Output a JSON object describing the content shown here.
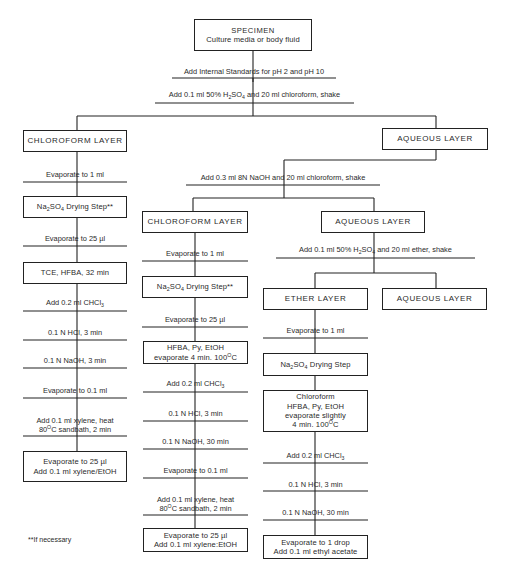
{
  "flowchart": {
    "specimen": {
      "title": "SPECIMEN",
      "subtitle": "Culture media or body fluid"
    },
    "step_internal_standards": "Add Internal Standards for pH 2 and pH 10",
    "step_acid_chloroform": {
      "pre": "Add 0.1 ml 50% H",
      "sub1": "2",
      "mid": "SO",
      "sub2": "4",
      "post": " and 20 ml chloroform, shake"
    },
    "left_branch": {
      "layer": "CHLOROFORM LAYER",
      "steps": {
        "evap_1ml": "Evaporate to 1 ml",
        "drying": {
          "pre": "Na",
          "sub1": "2",
          "mid": "SO",
          "sub2": "4",
          "post": " Drying Step**"
        },
        "evap_25ul": "Evaporate to 25 µl",
        "derivatize": "TCE, HFBA, 32 min",
        "add_chcl3": {
          "pre": "Add 0.2 ml CHCl",
          "sub": "3"
        },
        "hcl": "0.1 N HCl, 3 min",
        "naoh": "0.1 N NaOH, 3 min",
        "evap_01ml": "Evaporate to 0.1 ml",
        "xylene_line1": "Add 0.1 ml xylene, heat",
        "xylene_line2": {
          "pre": "80",
          "sup": "O",
          "post": "C sandbath, 2 min"
        },
        "final_line1": "Evaporate to 25 µl",
        "final_line2": "Add 0.1 ml xylene/EtOH"
      }
    },
    "right_branch": {
      "layer": "AQUEOUS LAYER",
      "step_base_chloroform": "Add 0.3 ml 8N NaOH and 20 ml chloroform, shake",
      "middle_branch": {
        "layer": "CHLOROFORM LAYER",
        "steps": {
          "evap_1ml": "Evaporate to 1 ml",
          "drying": {
            "pre": "Na",
            "sub1": "2",
            "mid": "SO",
            "sub2": "4",
            "post": " Drying Step**"
          },
          "evap_25ul": "Evaporate to 25 µl",
          "derivatize_line1": "HFBA, Py, EtOH",
          "derivatize_line2": {
            "pre": "evaporate 4 min. 100",
            "sup": "O",
            "post": "C"
          },
          "add_chcl3": {
            "pre": "Add 0.2 ml CHCl",
            "sub": "3"
          },
          "hcl": "0.1 N HCl, 3 min",
          "naoh": "0.1 N NaOH, 30 min",
          "evap_01ml": "Evaporate to 0.1 ml",
          "xylene_line1": "Add 0.1 ml xylene, heat",
          "xylene_line2": {
            "pre": "80",
            "sup": "O",
            "post": "C sandbath, 2 min"
          },
          "final_line1": "Evaporate to 25 µl",
          "final_line2": "Add 0.1 ml xylene:EtOH"
        }
      },
      "aqueous_branch": {
        "layer": "AQUEOUS LAYER",
        "step_acid_ether": {
          "pre": "Add 0.1 ml 50% H",
          "sub1": "2",
          "mid": "SO",
          "sub2": "4",
          "post": " and 20 ml ether, shake"
        },
        "ether_branch": {
          "layer": "ETHER LAYER",
          "steps": {
            "evap_1ml": "Evaporate to 1 ml",
            "drying": {
              "pre": "Na",
              "sub1": "2",
              "mid": "SO",
              "sub2": "4",
              "post": " Drying Step"
            },
            "derivatize_line1": "Chloroform",
            "derivatize_line2": "HFBA, Py, EtOH",
            "derivatize_line3": "evaporate slightly",
            "derivatize_line4": {
              "pre": "4 min. 100",
              "sup": "O",
              "post": "C"
            },
            "add_chcl3": {
              "pre": "Add 0.2 ml CHCl",
              "sub": "3"
            },
            "hcl": "0.1 N HCl, 3 min",
            "naoh": "0.1 N NaOH, 30 min",
            "final_line1": "Evaporate to 1 drop",
            "final_line2": "Add 0.1 ml ethyl acetate"
          }
        },
        "final_aqueous_layer": "AQUEOUS LAYER"
      }
    },
    "footnote": "**If necessary"
  }
}
